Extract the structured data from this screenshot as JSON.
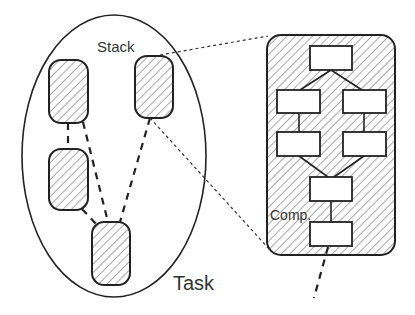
{
  "labels": {
    "stack": "Stack",
    "task": "Task",
    "component": "Comp."
  },
  "colors": {
    "stroke": "#222222",
    "hatch": "#555555",
    "text": "#333333",
    "background": "#ffffff",
    "box_fill": "#ffffff"
  },
  "task_ellipse": {
    "cx": 114,
    "cy": 156,
    "rx": 92,
    "ry": 141
  },
  "stacks": [
    {
      "id": "stack-left-top",
      "x": 49,
      "y": 60,
      "w": 39,
      "h": 63
    },
    {
      "id": "stack-right-top",
      "x": 135,
      "y": 56,
      "w": 38,
      "h": 62
    },
    {
      "id": "stack-left-mid",
      "x": 49,
      "y": 149,
      "w": 39,
      "h": 61
    },
    {
      "id": "stack-bottom",
      "x": 92,
      "y": 222,
      "w": 38,
      "h": 63
    }
  ],
  "stack_detail": {
    "x": 267,
    "y": 35,
    "w": 128,
    "h": 220,
    "r": 14
  },
  "components": [
    {
      "id": "comp-top",
      "x": 310,
      "y": 46,
      "w": 42,
      "h": 24
    },
    {
      "id": "comp-mid-left",
      "x": 277,
      "y": 90,
      "w": 43,
      "h": 23
    },
    {
      "id": "comp-mid-right",
      "x": 343,
      "y": 90,
      "w": 43,
      "h": 23
    },
    {
      "id": "comp-low-left",
      "x": 277,
      "y": 132,
      "w": 43,
      "h": 24
    },
    {
      "id": "comp-low-right",
      "x": 343,
      "y": 132,
      "w": 43,
      "h": 24
    },
    {
      "id": "comp-center",
      "x": 310,
      "y": 177,
      "w": 42,
      "h": 24
    },
    {
      "id": "comp-bottom",
      "x": 310,
      "y": 222,
      "w": 42,
      "h": 24
    }
  ]
}
